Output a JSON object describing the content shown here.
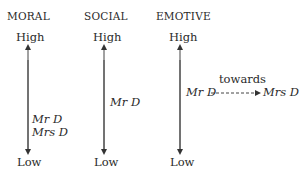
{
  "diagram": {
    "columns": [
      {
        "heading": "MORAL",
        "high_label": "High",
        "low_label": "Low",
        "markers": [
          "Mr D",
          "Mrs D"
        ]
      },
      {
        "heading": "SOCIAL",
        "high_label": "High",
        "low_label": "Low",
        "markers": [
          "Mr D"
        ]
      },
      {
        "heading": "EMOTIVE",
        "high_label": "High",
        "low_label": "Low",
        "shift": {
          "from": "Mr D",
          "to": "Mrs D",
          "label": "towards"
        }
      }
    ],
    "colors": {
      "text": "#2a2a2a",
      "line": "#444444"
    }
  }
}
